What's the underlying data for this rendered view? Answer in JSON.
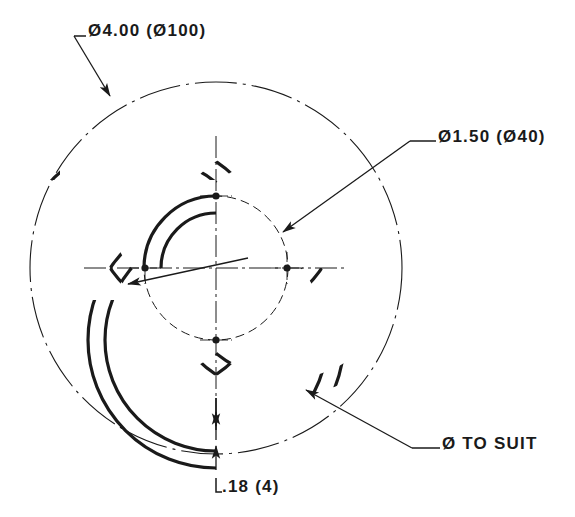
{
  "drawing": {
    "title": "Interlocked ring ornament",
    "view": "plan view",
    "units_note": "inch (millimetre)",
    "line_color": "#1a1a1a",
    "background_color": "#ffffff",
    "paper_size": {
      "width": 575,
      "height": 517
    }
  },
  "dimensions": {
    "outer_circle": {
      "label": "Ø4.00 (Ø100)",
      "symbol": "Ø",
      "value_inch": "4.00",
      "value_mm": "100",
      "target": "dash-dot construction circle"
    },
    "ring_diameter": {
      "label": "Ø1.50 (Ø40)",
      "symbol": "Ø",
      "value_inch": "1.50",
      "value_mm": "40",
      "target": "ring centreline diameter"
    },
    "band_thickness": {
      "label": ".18 (4)",
      "value_inch": ".18",
      "value_mm": "4",
      "target": "ring band width"
    },
    "hole": {
      "label": "Ø TO SUIT",
      "symbol": "Ø",
      "value_inch": "TO SUIT",
      "target": "mounting hole"
    }
  },
  "geometry": {
    "center": {
      "x": 216,
      "y": 268
    },
    "outer_circle_radius": 186,
    "bolt_circle_radius": 72,
    "ring_outer_radius": 128,
    "ring_inner_radius": 111,
    "small_ring_outer_radius": 72,
    "small_ring_inner_radius": 55,
    "ring_centers": [
      {
        "name": "top",
        "x": 216,
        "y": 196
      },
      {
        "name": "left",
        "x": 145,
        "y": 268
      },
      {
        "name": "right",
        "x": 287,
        "y": 268
      },
      {
        "name": "bottom",
        "x": 216,
        "y": 340
      }
    ]
  },
  "icons": {
    "diameter": "diameter-symbol",
    "arrow": "leader-arrowhead"
  }
}
